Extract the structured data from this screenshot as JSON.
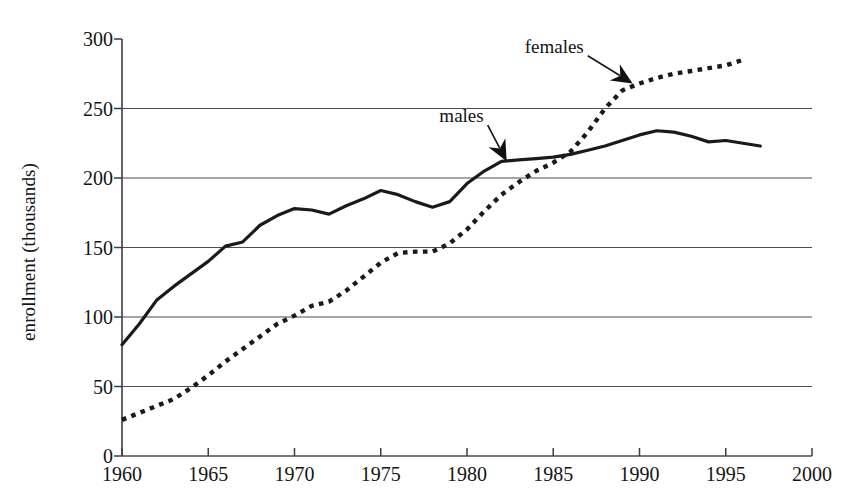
{
  "chart_data": {
    "type": "line",
    "title": "",
    "xlabel": "",
    "ylabel": "enrollment (thousands)",
    "xlim": [
      1960,
      2000
    ],
    "ylim": [
      0,
      300
    ],
    "grid": true,
    "legend_position": "inline-annotation",
    "x_ticks": [
      "1960",
      "1965",
      "1970",
      "1975",
      "1980",
      "1985",
      "1990",
      "1995",
      "2000"
    ],
    "x_tick_values": [
      1960,
      1965,
      1970,
      1975,
      1980,
      1985,
      1990,
      1995,
      2000
    ],
    "y_ticks": [
      "0",
      "50",
      "100",
      "150",
      "200",
      "250",
      "300"
    ],
    "y_tick_values": [
      0,
      50,
      100,
      150,
      200,
      250,
      300
    ],
    "annotations": [
      {
        "text": "males",
        "label_x": 1981.2,
        "label_y": 238,
        "arrow_to_x": 1982.3,
        "arrow_to_y": 212
      },
      {
        "text": "females",
        "label_x": 1987.0,
        "label_y": 288,
        "arrow_to_x": 1989.6,
        "arrow_to_y": 268
      }
    ],
    "series": [
      {
        "name": "males",
        "style": "solid",
        "color": "#1a1a1a",
        "x": [
          1960,
          1961,
          1962,
          1963,
          1964,
          1965,
          1966,
          1967,
          1968,
          1969,
          1970,
          1971,
          1972,
          1973,
          1974,
          1975,
          1976,
          1977,
          1978,
          1979,
          1980,
          1981,
          1982,
          1983,
          1984,
          1985,
          1986,
          1987,
          1988,
          1989,
          1990,
          1991,
          1992,
          1993,
          1994,
          1995,
          1996,
          1997
        ],
        "values": [
          80,
          95,
          112,
          122,
          131,
          140,
          151,
          154,
          166,
          173,
          178,
          177,
          174,
          180,
          185,
          191,
          188,
          183,
          179,
          183,
          196,
          205,
          212,
          213,
          214,
          215,
          217,
          220,
          223,
          227,
          231,
          234,
          233,
          230,
          226,
          227,
          225,
          223
        ]
      },
      {
        "name": "females",
        "style": "dotted",
        "color": "#1a1a1a",
        "x": [
          1960,
          1961,
          1962,
          1963,
          1964,
          1965,
          1966,
          1967,
          1968,
          1969,
          1970,
          1971,
          1972,
          1973,
          1974,
          1975,
          1976,
          1977,
          1978,
          1979,
          1980,
          1981,
          1982,
          1983,
          1984,
          1985,
          1986,
          1987,
          1988,
          1989,
          1990,
          1991,
          1992,
          1993,
          1994,
          1995,
          1996
        ],
        "values": [
          26,
          31,
          36,
          41,
          49,
          58,
          68,
          77,
          86,
          95,
          101,
          108,
          111,
          119,
          129,
          139,
          146,
          147,
          147,
          153,
          163,
          176,
          188,
          197,
          205,
          211,
          219,
          233,
          250,
          263,
          268,
          272,
          275,
          277,
          279,
          281,
          285
        ]
      }
    ]
  },
  "geometry": {
    "plot_left": 122,
    "plot_right": 812,
    "plot_top": 39,
    "plot_bottom": 456
  }
}
